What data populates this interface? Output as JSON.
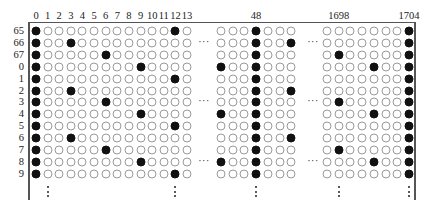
{
  "diagram": {
    "type": "bit-grid",
    "column_header_labels": [
      {
        "label": "0",
        "col": "0"
      },
      {
        "label": "1",
        "col": "1"
      },
      {
        "label": "2",
        "col": "2"
      },
      {
        "label": "3",
        "col": "3"
      },
      {
        "label": "4",
        "col": "4"
      },
      {
        "label": "5",
        "col": "5"
      },
      {
        "label": "6",
        "col": "6"
      },
      {
        "label": "7",
        "col": "7"
      },
      {
        "label": "8",
        "col": "8"
      },
      {
        "label": "9",
        "col": "9"
      },
      {
        "label": "10",
        "col": "10"
      },
      {
        "label": "11",
        "col": "11"
      },
      {
        "label": "12",
        "col": "12"
      },
      {
        "label": "13",
        "col": "13"
      },
      {
        "label": "48",
        "col": "48"
      },
      {
        "label": "1698",
        "col": "1698"
      },
      {
        "label": "1704",
        "col": "1704"
      }
    ],
    "row_labels": [
      "65",
      "66",
      "67",
      "0",
      "1",
      "2",
      "3",
      "4",
      "5",
      "6",
      "7",
      "8",
      "9"
    ],
    "segments": [
      {
        "name": "left",
        "columns": [
          0,
          1,
          2,
          3,
          4,
          5,
          6,
          7,
          8,
          9,
          10,
          11,
          12,
          13
        ]
      },
      {
        "name": "middle",
        "columns": [
          45,
          46,
          47,
          48,
          49,
          50,
          51
        ]
      },
      {
        "name": "right",
        "columns": [
          1697,
          1698,
          1699,
          1700,
          1701,
          1702,
          1703,
          1704
        ]
      }
    ],
    "filled": {
      "65": [
        0,
        12,
        48,
        1704
      ],
      "66": [
        0,
        3,
        48,
        51,
        1704
      ],
      "67": [
        0,
        6,
        48,
        1698,
        1704
      ],
      "0": [
        0,
        9,
        45,
        48,
        1701,
        1704
      ],
      "1": [
        0,
        12,
        48,
        1704
      ],
      "2": [
        0,
        3,
        48,
        51,
        1704
      ],
      "3": [
        0,
        6,
        48,
        1698,
        1704
      ],
      "4": [
        0,
        9,
        45,
        48,
        1701,
        1704
      ],
      "5": [
        0,
        12,
        48,
        1704
      ],
      "6": [
        0,
        3,
        48,
        51,
        1704
      ],
      "7": [
        0,
        6,
        48,
        1698,
        1704
      ],
      "8": [
        0,
        9,
        45,
        48,
        1701,
        1704
      ],
      "9": [
        0,
        12,
        48,
        1704
      ]
    },
    "horizontal_ellipsis": "···",
    "horizontal_ellipsis_rows": [
      "66",
      "3",
      "8"
    ],
    "vertical_ellipsis_columns": [
      1,
      12,
      48,
      1698,
      1704
    ]
  }
}
